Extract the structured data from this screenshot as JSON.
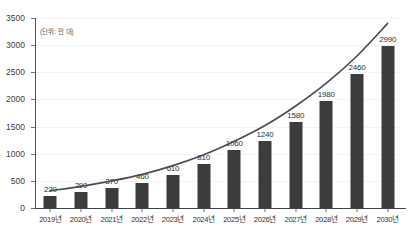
{
  "chart_data": {
    "type": "bar",
    "title": "",
    "subtitle": "",
    "unit_label": "(단위: 만 대)",
    "xlabel": "",
    "ylabel": "",
    "categories": [
      "2019년",
      "2020년",
      "2021년",
      "2022년",
      "2023년",
      "2024년",
      "2025년",
      "2026년",
      "2027년",
      "2028년",
      "2029년",
      "2030년"
    ],
    "values": [
      220,
      290,
      370,
      460,
      610,
      810,
      1060,
      1240,
      1580,
      1980,
      2460,
      2990
    ],
    "value_labels": [
      "220",
      "290",
      "370",
      "460",
      "610",
      "810",
      "1060",
      "1240",
      "1580",
      "1980",
      "2460",
      "2990"
    ],
    "ylim": [
      0,
      3500
    ],
    "ytick_labels": [
      "0",
      "500",
      "1000",
      "1500",
      "2000",
      "2500",
      "3000",
      "3500"
    ],
    "yticks": [
      0,
      500,
      1000,
      1500,
      2000,
      2500,
      3000,
      3500
    ],
    "grid": true,
    "legend": "none",
    "series": [
      {
        "name": "bars",
        "kind": "bar",
        "color": "#3c3c3e",
        "values": [
          220,
          290,
          370,
          460,
          610,
          810,
          1060,
          1240,
          1580,
          1980,
          2460,
          2990
        ]
      },
      {
        "name": "trend",
        "kind": "line",
        "color": "#4a4d52",
        "values": [
          320,
          400,
          500,
          620,
          780,
          980,
          1230,
          1520,
          1880,
          2300,
          2800,
          3400
        ]
      }
    ],
    "colors": {
      "bar": "#3c3c3e",
      "trend_line": "#4a4d52",
      "axis": "#53575c",
      "grid": "#f4f4f5",
      "text": "#2f3234",
      "background": "#ffffff"
    }
  }
}
